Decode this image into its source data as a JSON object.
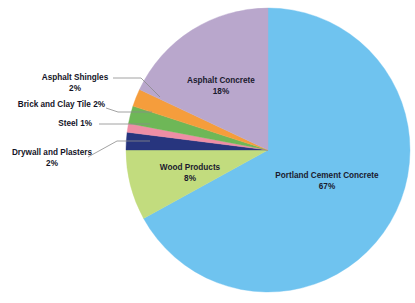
{
  "chart_data": {
    "type": "pie",
    "title": "",
    "subtitle": "",
    "xlabel": "",
    "ylabel": "",
    "legend_position": "none",
    "grid": false,
    "unit": "%",
    "categories": [
      "Portland Cement Concrete",
      "Wood Products",
      "Drywall and Plasters",
      "Steel",
      "Brick and Clay Tile",
      "Asphalt Shingles",
      "Asphalt Concrete"
    ],
    "values": [
      67,
      8,
      2,
      1,
      2,
      2,
      18
    ],
    "slices": [
      {
        "label": "Portland Cement Concrete",
        "value": 67,
        "value_text": "67%",
        "color": "#6fc3ef",
        "label_placement": "inside",
        "label_text": "Portland Cement Concrete",
        "label_x": 327,
        "label_y": 176,
        "pct_x": 327,
        "pct_y": 187
      },
      {
        "label": "Wood Products",
        "value": 8,
        "value_text": "8%",
        "color": "#c2dc7e",
        "label_placement": "inside",
        "label_text": "Wood Products",
        "label_x": 190,
        "label_y": 168,
        "pct_x": 190,
        "pct_y": 179
      },
      {
        "label": "Drywall and Plasters",
        "value": 2,
        "value_text": "2%",
        "color": "#27357e",
        "label_placement": "callout",
        "label_text": "Drywall and Plasters",
        "label_x": 52,
        "label_y": 153,
        "pct_x": 52,
        "pct_y": 164,
        "align": "center-al",
        "leader": "M 88,157 L 117,141 L 150,141"
      },
      {
        "label": "Steel",
        "value": 1,
        "value_text": "1%",
        "color": "#ef8ea5",
        "label_placement": "callout",
        "label_text": "Steel  1%",
        "label_x": 92,
        "label_y": 124,
        "pct_x": null,
        "pct_y": null,
        "align": "right-al",
        "leader": "M 99,124 L 150,124"
      },
      {
        "label": "Brick and Clay Tile",
        "value": 2,
        "value_text": "2%",
        "color": "#6eb757",
        "label_placement": "callout",
        "label_text": "Brick and Clay Tile 2%",
        "label_x": 105,
        "label_y": 105,
        "pct_x": null,
        "pct_y": null,
        "align": "right-al",
        "leader": "M 106,108 L 118,112 L 152,112"
      },
      {
        "label": "Asphalt Shingles",
        "value": 2,
        "value_text": "2%",
        "color": "#f59d3c",
        "label_placement": "callout",
        "label_text": "Asphalt Shingles",
        "label_x": 75,
        "label_y": 78,
        "pct_x": 75,
        "pct_y": 89,
        "align": "center-al",
        "leader": "M 113,78 L 141,78 L 160,97"
      },
      {
        "label": "Asphalt Concrete",
        "value": 18,
        "value_text": "18%",
        "color": "#b9a7cc",
        "label_placement": "inside",
        "label_text": "Asphalt Concrete",
        "label_x": 221,
        "label_y": 81,
        "pct_x": 221,
        "pct_y": 92
      }
    ],
    "geometry": {
      "center_x": 268,
      "center_y": 150,
      "radius": 142,
      "start_angle_deg": -90,
      "direction": "clockwise"
    },
    "colors": {
      "background": "#ffffff",
      "text": "#141427",
      "leader_line": "#8a8a8a"
    }
  }
}
